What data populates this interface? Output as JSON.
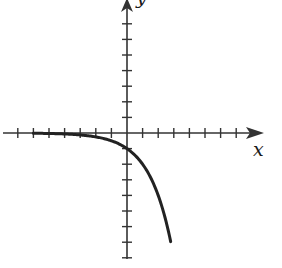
{
  "chart_data": {
    "type": "line",
    "title": "",
    "xlabel": "x",
    "ylabel": "y",
    "function": "y = -2^x",
    "xlim": [
      -7,
      8.5
    ],
    "ylim": [
      -8,
      8.5
    ],
    "x_ticks": [
      -7,
      -6,
      -5,
      -4,
      -3,
      -2,
      -1,
      1,
      2,
      3,
      4,
      5,
      6,
      7
    ],
    "y_ticks": [
      -8,
      -7,
      -6,
      -5,
      -4,
      -3,
      -2,
      -1,
      1,
      2,
      3,
      4,
      5,
      6,
      7
    ],
    "tick_labels_shown": false,
    "grid": false,
    "series": [
      {
        "name": "curve",
        "color": "#222222",
        "x": [
          -6,
          -5,
          -4,
          -3,
          -2,
          -1,
          0,
          0.5,
          1,
          1.5,
          2,
          2.5,
          2.8
        ],
        "y": [
          -0.016,
          -0.031,
          -0.063,
          -0.125,
          -0.25,
          -0.5,
          -1,
          -1.41,
          -2,
          -2.83,
          -4,
          -5.66,
          -6.96
        ]
      }
    ],
    "y_intercept": -1,
    "horizontal_asymptote": 0
  },
  "labels": {
    "x_axis": "x",
    "y_axis": "y"
  },
  "colors": {
    "axis": "#333333",
    "curve": "#222222",
    "background": "#ffffff"
  }
}
